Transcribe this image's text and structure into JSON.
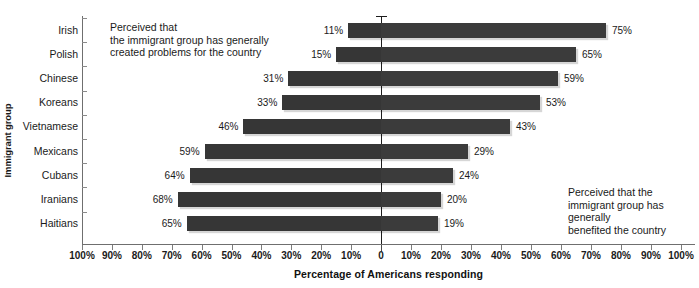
{
  "chart_data": {
    "type": "bar",
    "subtype": "diverging-horizontal-bar",
    "title": "",
    "xlabel": "Percentage of Americans responding",
    "ylabel": "Immigrant group",
    "categories": [
      "Irish",
      "Polish",
      "Chinese",
      "Koreans",
      "Vietnamese",
      "Mexicans",
      "Cubans",
      "Iranians",
      "Haitians"
    ],
    "series": [
      {
        "name": "Perceived that the immigrant group has generally created problems for the country",
        "direction": "left",
        "values": [
          11,
          15,
          31,
          33,
          46,
          59,
          64,
          68,
          65
        ],
        "labels": [
          "11%",
          "15%",
          "31%",
          "33%",
          "46%",
          "59%",
          "64%",
          "68%",
          "65%"
        ]
      },
      {
        "name": "Perceived that the immigrant group has generally benefited the country",
        "direction": "right",
        "values": [
          75,
          65,
          59,
          53,
          43,
          29,
          24,
          20,
          19
        ],
        "labels": [
          "75%",
          "65%",
          "59%",
          "53%",
          "43%",
          "29%",
          "24%",
          "20%",
          "19%"
        ]
      }
    ],
    "x_ticks": [
      {
        "value": -100,
        "label": "100%"
      },
      {
        "value": -90,
        "label": "90%"
      },
      {
        "value": -80,
        "label": "80%"
      },
      {
        "value": -70,
        "label": "70%"
      },
      {
        "value": -60,
        "label": "60%"
      },
      {
        "value": -50,
        "label": "50%"
      },
      {
        "value": -40,
        "label": "40%"
      },
      {
        "value": -30,
        "label": "30%"
      },
      {
        "value": -20,
        "label": "20%"
      },
      {
        "value": -10,
        "label": "10%"
      },
      {
        "value": 0,
        "label": "0"
      },
      {
        "value": 10,
        "label": "10%"
      },
      {
        "value": 20,
        "label": "20%"
      },
      {
        "value": 30,
        "label": "30%"
      },
      {
        "value": 40,
        "label": "40%"
      },
      {
        "value": 50,
        "label": "50%"
      },
      {
        "value": 60,
        "label": "60%"
      },
      {
        "value": 70,
        "label": "70%"
      },
      {
        "value": 80,
        "label": "80%"
      },
      {
        "value": 90,
        "label": "90%"
      },
      {
        "value": 100,
        "label": "100%"
      }
    ],
    "xlim": [
      -100,
      100
    ],
    "grid": false,
    "legend_position": "inline-annotations",
    "bar_color": "#3b3b3b",
    "zero_line_color": "#1d1d1d",
    "axis_color": "#6f6f6f"
  },
  "annotations": {
    "left": "Perceived that\nthe immigrant group has generally\ncreated problems for the country",
    "right": "Perceived that the\nimmigrant group has generally\nbenefited the country"
  },
  "axis": {
    "y_title": "Immigrant group",
    "x_title": "Percentage of Americans responding"
  }
}
